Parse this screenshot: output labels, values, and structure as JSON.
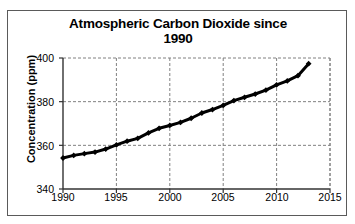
{
  "chart_data": {
    "type": "line",
    "title": "Atmospheric Carbon Dioxide since 1990",
    "title_line1": "Atmospheric Carbon Dioxide since",
    "title_line2": "1990",
    "xlabel": "",
    "ylabel": "Concentration  (ppm)",
    "xlim": [
      1990,
      2015
    ],
    "ylim": [
      340,
      400
    ],
    "xticks": [
      1990,
      1995,
      2000,
      2005,
      2010,
      2015
    ],
    "yticks": [
      340,
      360,
      380,
      400
    ],
    "xtick_labels": [
      "1990",
      "1995",
      "2000",
      "2005",
      "2010",
      "2015"
    ],
    "ytick_labels": [
      "340",
      "360",
      "380",
      "400"
    ],
    "grid": true,
    "grid_style": "dashed",
    "grid_color": "#808080",
    "legend": false,
    "marker": "diamond",
    "line_color": "#000000",
    "marker_color": "#000000",
    "line_width": 3,
    "x": [
      1990,
      1991,
      1992,
      1993,
      1994,
      1995,
      1996,
      1997,
      1998,
      1999,
      2000,
      2001,
      2002,
      2003,
      2004,
      2005,
      2006,
      2007,
      2008,
      2009,
      2010,
      2011,
      2012,
      2013
    ],
    "values": [
      354.2,
      355.4,
      356.2,
      356.9,
      358.3,
      360.2,
      361.9,
      363.2,
      365.7,
      367.8,
      369.1,
      370.5,
      372.4,
      374.8,
      376.4,
      378.3,
      380.5,
      382.0,
      383.5,
      385.3,
      387.7,
      389.5,
      391.9,
      397.4
    ],
    "source_note": ""
  }
}
